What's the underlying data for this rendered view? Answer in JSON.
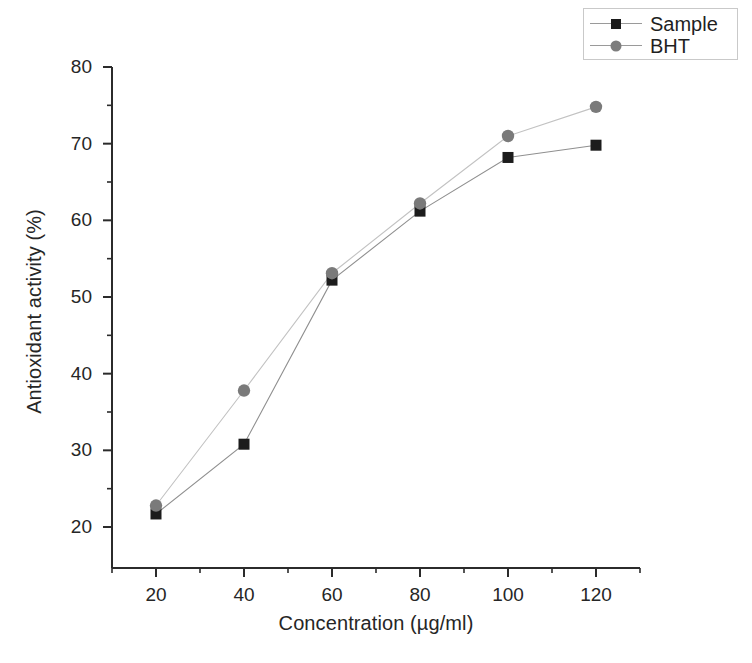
{
  "chart_data": {
    "type": "line",
    "title": "",
    "subtitle": "",
    "xlabel": "Concentration (µg/ml)",
    "ylabel": "Antioxidant activity (%)",
    "x": [
      20,
      40,
      60,
      80,
      100,
      120
    ],
    "xlim": [
      10,
      130
    ],
    "ylim": [
      17,
      80
    ],
    "xticks": [
      20,
      40,
      60,
      80,
      100,
      120
    ],
    "xtick_labels": [
      "20",
      "40",
      "60",
      "80",
      "100",
      "120"
    ],
    "xminor_ticks": [
      10,
      30,
      50,
      70,
      90,
      110,
      130
    ],
    "yticks": [
      20,
      30,
      40,
      50,
      60,
      70,
      80
    ],
    "ytick_labels": [
      "20",
      "30",
      "40",
      "50",
      "60",
      "70",
      "80"
    ],
    "yminor_ticks": [
      25,
      35,
      45,
      55,
      65,
      75
    ],
    "grid": false,
    "legend_position": "top-right",
    "series": [
      {
        "name": "Sample",
        "marker": "square",
        "color": "#1c1c1c",
        "line_color": "#8f8f8f",
        "values": [
          21.7,
          30.8,
          52.2,
          61.2,
          68.2,
          69.8
        ]
      },
      {
        "name": "BHT",
        "marker": "circle",
        "color": "#7a7a7a",
        "line_color": "#c2c2c2",
        "values": [
          22.8,
          37.8,
          53.1,
          62.2,
          71.0,
          74.8
        ]
      }
    ]
  },
  "legend": {
    "items": [
      {
        "label": "Sample"
      },
      {
        "label": "BHT"
      }
    ]
  },
  "colors": {
    "sample_marker": "#1c1c1c",
    "bht_marker": "#7a7a7a",
    "axis": "#2b2b2b",
    "legend_border": "#c9c9c9",
    "background": "#ffffff"
  }
}
